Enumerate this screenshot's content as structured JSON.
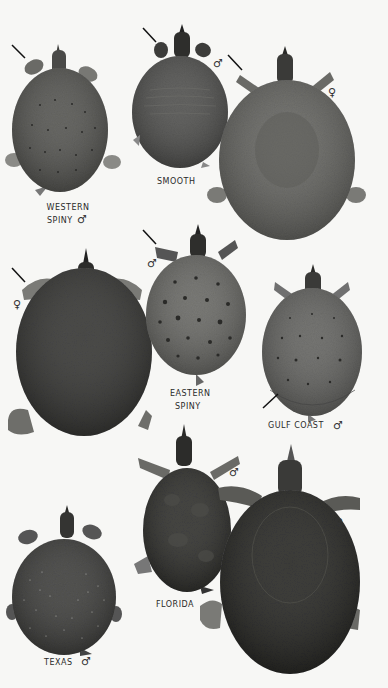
{
  "plate": {
    "background": "#f7f7f5",
    "specimens": [
      {
        "id": "western-spiny",
        "label_lines": [
          "WESTERN",
          "SPINY"
        ],
        "sex": "♂",
        "shell_color": "#5a5a56",
        "pattern": "small dots",
        "arrow": true
      },
      {
        "id": "smooth-male",
        "label_lines": [
          "SMOOTH"
        ],
        "sex": "♂",
        "shell_color": "#555553",
        "pattern": "faint lines",
        "arrow": true
      },
      {
        "id": "smooth-female",
        "label_lines": [],
        "sex": "♀",
        "shell_color": "#6a6a66",
        "pattern": "mottled",
        "arrow": true
      },
      {
        "id": "eastern-spiny-female",
        "label_lines": [],
        "sex": "♀",
        "shell_color": "#3a3a38",
        "pattern": "mottled dark",
        "arrow": true
      },
      {
        "id": "eastern-spiny-male",
        "label_lines": [
          "EASTERN",
          "SPINY"
        ],
        "sex": "♂",
        "shell_color": "#6e6e6a",
        "pattern": "ocelli spots",
        "arrow": true
      },
      {
        "id": "gulf-coast",
        "label_lines": [
          "GULF COAST"
        ],
        "sex": "♂",
        "shell_color": "#696966",
        "pattern": "dots and dashes",
        "arrow": true
      },
      {
        "id": "florida-male",
        "label_lines": [
          "FLORIDA"
        ],
        "sex": "♂",
        "shell_color": "#333331",
        "pattern": "blotched",
        "arrow": false
      },
      {
        "id": "florida-female",
        "label_lines": [],
        "sex": "♀",
        "shell_color": "#2b2b29",
        "pattern": "blotched",
        "arrow": false
      },
      {
        "id": "texas",
        "label_lines": [
          "TEXAS"
        ],
        "sex": "♂",
        "shell_color": "#434341",
        "pattern": "white speckles",
        "arrow": false
      }
    ]
  }
}
